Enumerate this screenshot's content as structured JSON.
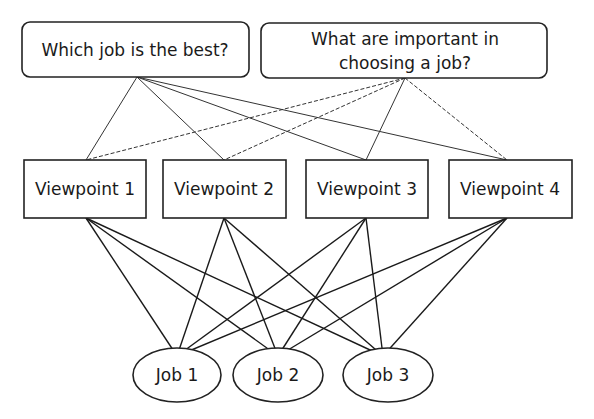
{
  "diagram": {
    "questions": [
      {
        "id": "q1",
        "label": "Which job is the best?"
      },
      {
        "id": "q2",
        "line1": "What are important in",
        "line2": "choosing a job?"
      }
    ],
    "viewpoints": [
      {
        "id": "v1",
        "label": "Viewpoint 1"
      },
      {
        "id": "v2",
        "label": "Viewpoint 2"
      },
      {
        "id": "v3",
        "label": "Viewpoint 3"
      },
      {
        "id": "v4",
        "label": "Viewpoint 4"
      }
    ],
    "jobs": [
      {
        "id": "j1",
        "label": "Job 1"
      },
      {
        "id": "j2",
        "label": "Job 2"
      },
      {
        "id": "j3",
        "label": "Job 3"
      }
    ],
    "edges": {
      "question1_to_viewpoints": {
        "style": "solid",
        "targets": [
          "v1",
          "v2",
          "v3",
          "v4"
        ]
      },
      "question2_to_viewpoints": {
        "style": "dashed",
        "targets": [
          "v1",
          "v2",
          "v3",
          "v4"
        ]
      },
      "viewpoints_to_jobs": {
        "style": "solid",
        "all_pairs": true
      }
    },
    "colors": {
      "stroke": "#222222",
      "text": "#1a1a1a",
      "background": "#ffffff"
    }
  }
}
